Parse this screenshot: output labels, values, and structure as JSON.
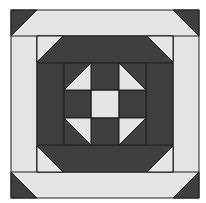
{
  "diagram": {
    "type": "quilt-block",
    "colors": {
      "dark": "#3f3f3f",
      "light": "#e4e4e4",
      "line": "#1e1e1e",
      "background": "#ffffff"
    },
    "outer": {
      "x": 11,
      "y": 10,
      "size": 188,
      "band": 26
    },
    "middle": {
      "x": 37,
      "y": 36,
      "size": 136,
      "band": 27
    },
    "center": {
      "x": 64,
      "y": 63,
      "size": 82
    }
  }
}
